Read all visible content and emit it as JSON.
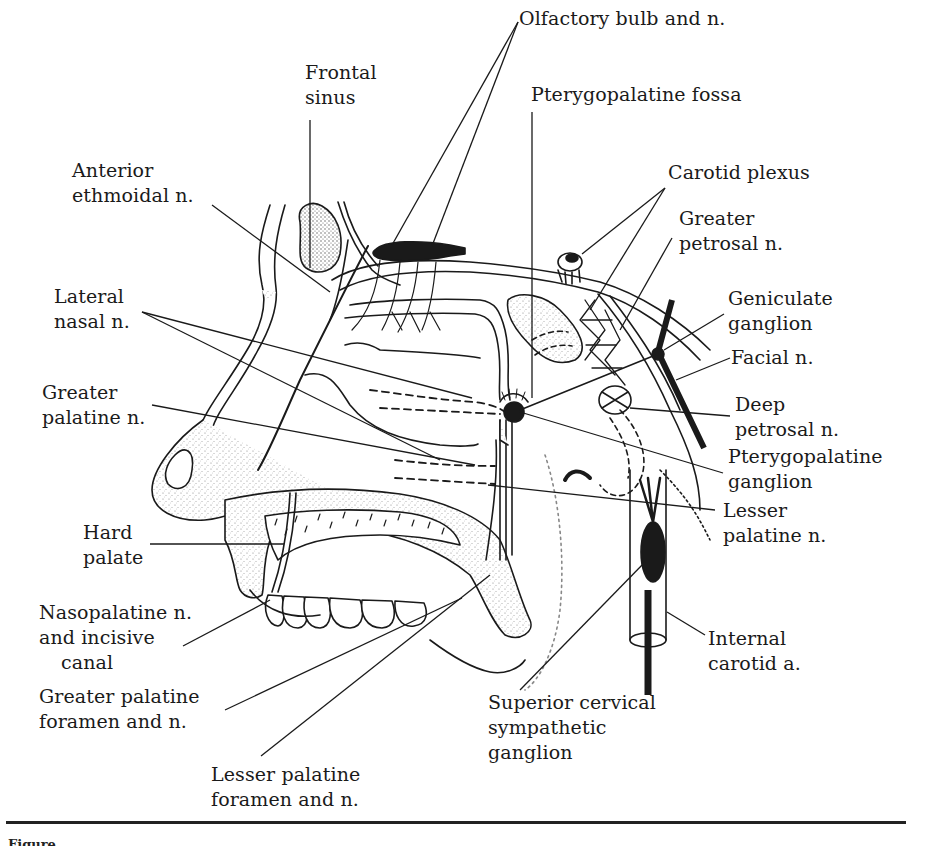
{
  "figure": {
    "kind": "anatomical line drawing",
    "caption_fragment": "Figure"
  },
  "labels": {
    "frontal_sinus": [
      "Frontal",
      "sinus"
    ],
    "olfactory_bulb": [
      "Olfactory bulb and n."
    ],
    "pterygopalatine_fossa": [
      "Pterygopalatine fossa"
    ],
    "anterior_ethmoidal": [
      "Anterior",
      "ethmoidal n."
    ],
    "carotid_plexus": [
      "Carotid plexus"
    ],
    "greater_petrosal": [
      "Greater",
      "petrosal n."
    ],
    "lateral_nasal": [
      "Lateral",
      "nasal n."
    ],
    "geniculate_ganglion": [
      "Geniculate",
      "ganglion"
    ],
    "facial_nerve": [
      "Facial n."
    ],
    "greater_palatine_n": [
      "Greater",
      "palatine n."
    ],
    "deep_petrosal": [
      "Deep",
      "petrosal n."
    ],
    "pterygopalatine_ganglion": [
      "Pterygopalatine",
      "ganglion"
    ],
    "lesser_palatine_n": [
      "Lesser",
      "palatine n."
    ],
    "hard_palate": [
      "Hard",
      "palate"
    ],
    "nasopalatine": [
      "Nasopalatine n.",
      "and incisive",
      "canal"
    ],
    "internal_carotid": [
      "Internal",
      "carotid a."
    ],
    "greater_palatine_foramen": [
      "Greater palatine",
      "foramen and n."
    ],
    "superior_cervical": [
      "Superior cervical",
      "sympathetic",
      "ganglion"
    ],
    "lesser_palatine_foramen": [
      "Lesser palatine",
      "foramen and n."
    ]
  },
  "colors": {
    "ink": "#1a1a1a",
    "stipple": "#c9c9c9",
    "background": "#ffffff"
  }
}
